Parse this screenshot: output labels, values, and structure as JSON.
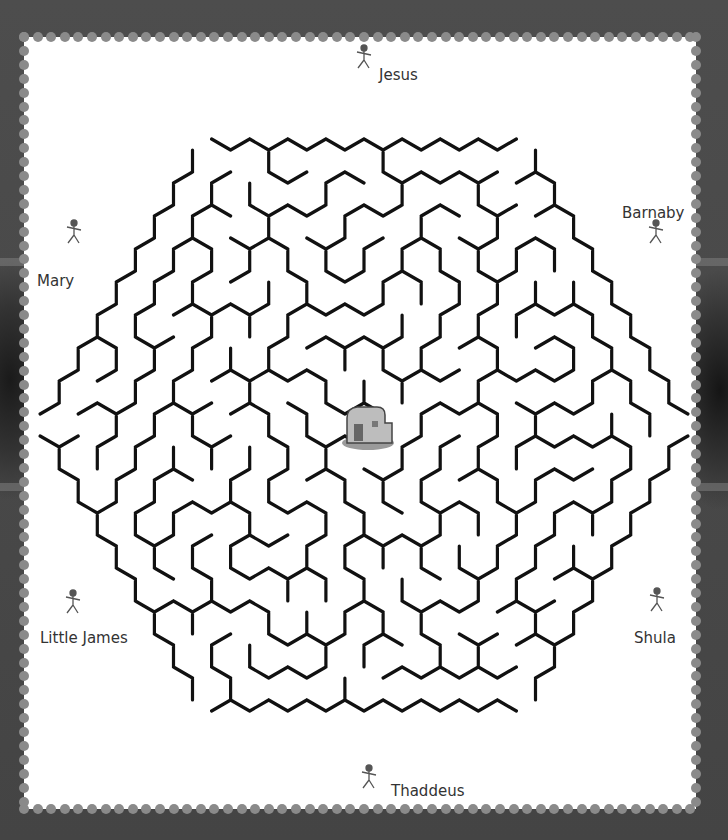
{
  "puzzle": {
    "type": "hexagonal maze",
    "goal": "house",
    "characters": [
      {
        "name": "Jesus",
        "x": 392,
        "y": 75,
        "fig_x": 364,
        "fig_y": 62
      },
      {
        "name": "Barnaby",
        "x": 622,
        "y": 213,
        "fig_x": 656,
        "fig_y": 237
      },
      {
        "name": "Mary",
        "x": 37,
        "y": 282,
        "fig_x": 74,
        "fig_y": 237
      },
      {
        "name": "Little James",
        "x": 40,
        "y": 638,
        "fig_x": 73,
        "fig_y": 607
      },
      {
        "name": "Shula",
        "x": 634,
        "y": 638,
        "fig_x": 657,
        "fig_y": 605
      },
      {
        "name": "Thaddeus",
        "x": 391,
        "y": 791,
        "fig_x": 369,
        "fig_y": 782
      }
    ]
  },
  "colors": {
    "wall": "#111111",
    "paper": "#ffffff",
    "frame": "#4a4a4a",
    "perforation": "#8a8a8a",
    "figure": "#555555"
  }
}
